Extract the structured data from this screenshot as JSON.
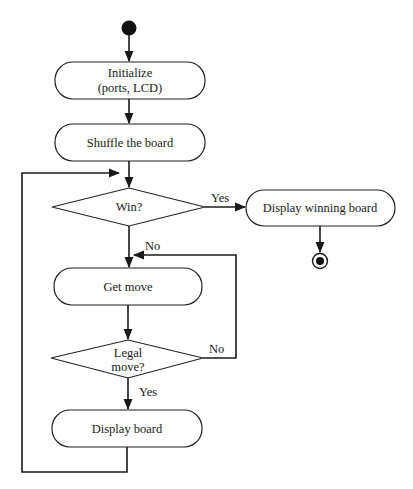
{
  "diagram": {
    "type": "activity-flowchart",
    "nodes": {
      "start": {
        "kind": "initial-node"
      },
      "initialize": {
        "kind": "action",
        "line1": "Initialize",
        "line2": "(ports, LCD)"
      },
      "shuffle": {
        "kind": "action",
        "label": "Shuffle the board"
      },
      "win": {
        "kind": "decision",
        "label": "Win?"
      },
      "display_winning": {
        "kind": "action",
        "label": "Display winning board"
      },
      "end": {
        "kind": "final-node"
      },
      "get_move": {
        "kind": "action",
        "label": "Get move"
      },
      "legal": {
        "kind": "decision",
        "line1": "Legal",
        "line2": "move?"
      },
      "display_board": {
        "kind": "action",
        "label": "Display board"
      }
    },
    "edges": [
      {
        "from": "start",
        "to": "initialize",
        "label": ""
      },
      {
        "from": "initialize",
        "to": "shuffle",
        "label": ""
      },
      {
        "from": "shuffle",
        "to": "win",
        "label": ""
      },
      {
        "from": "win",
        "to": "display_winning",
        "label": "Yes"
      },
      {
        "from": "display_winning",
        "to": "end",
        "label": ""
      },
      {
        "from": "win",
        "to": "get_move",
        "label": "No"
      },
      {
        "from": "get_move",
        "to": "legal",
        "label": ""
      },
      {
        "from": "legal",
        "to": "get_move",
        "label": "No"
      },
      {
        "from": "legal",
        "to": "display_board",
        "label": "Yes"
      },
      {
        "from": "display_board",
        "to": "win",
        "label": ""
      }
    ],
    "labels": {
      "win_yes": "Yes",
      "win_no": "No",
      "legal_no": "No",
      "legal_yes": "Yes"
    },
    "colors": {
      "stroke": "#222222",
      "fill": "#ffffff",
      "text": "#1a1a1a"
    }
  }
}
